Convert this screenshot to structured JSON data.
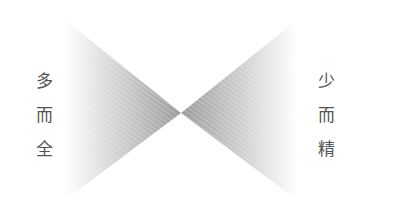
{
  "diagram": {
    "left_label": [
      "多",
      "而",
      "全"
    ],
    "right_label": [
      "少",
      "而",
      "精"
    ],
    "colors": {
      "apex_gray": "#a0a0a0",
      "edge_fade": "#ffffff",
      "text": "#555555"
    }
  }
}
